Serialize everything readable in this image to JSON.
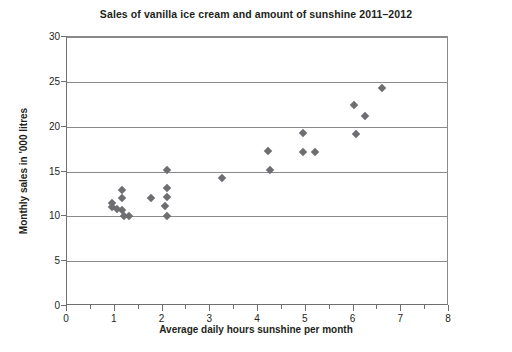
{
  "chart_data": {
    "type": "scatter",
    "title": "Sales of vanilla ice cream and amount of sunshine 2011–2012",
    "xlabel": "Average daily hours sunshine per month",
    "ylabel": "Monthly sales in '000 litres",
    "xlim": [
      0,
      8
    ],
    "ylim": [
      0,
      30
    ],
    "xticks": [
      0,
      1,
      2,
      3,
      4,
      5,
      6,
      7,
      8
    ],
    "xtick_labels": [
      "0",
      "1",
      "2",
      "3",
      "4",
      "5",
      "6",
      "7",
      "8"
    ],
    "xminor_step": 0.5,
    "yticks": [
      0,
      5,
      10,
      15,
      20,
      25,
      30
    ],
    "ytick_labels": [
      "0",
      "5",
      "10",
      "15",
      "20",
      "25",
      "30"
    ],
    "grid": "horizontal",
    "legend": null,
    "marker": "diamond",
    "marker_color": "#6e6e72",
    "points": [
      {
        "x": 0.95,
        "y": 11.5
      },
      {
        "x": 0.95,
        "y": 11.0
      },
      {
        "x": 1.15,
        "y": 12.9
      },
      {
        "x": 1.15,
        "y": 12.0
      },
      {
        "x": 1.05,
        "y": 10.8
      },
      {
        "x": 1.15,
        "y": 10.7
      },
      {
        "x": 1.2,
        "y": 10.0
      },
      {
        "x": 1.3,
        "y": 10.0
      },
      {
        "x": 1.75,
        "y": 12.1
      },
      {
        "x": 2.1,
        "y": 15.2
      },
      {
        "x": 2.1,
        "y": 13.2
      },
      {
        "x": 2.1,
        "y": 12.2
      },
      {
        "x": 2.05,
        "y": 11.2
      },
      {
        "x": 2.1,
        "y": 10.0
      },
      {
        "x": 3.25,
        "y": 14.3
      },
      {
        "x": 4.2,
        "y": 17.3
      },
      {
        "x": 4.25,
        "y": 15.2
      },
      {
        "x": 4.95,
        "y": 19.3
      },
      {
        "x": 4.95,
        "y": 17.2
      },
      {
        "x": 5.2,
        "y": 17.2
      },
      {
        "x": 6.0,
        "y": 22.4
      },
      {
        "x": 6.05,
        "y": 19.2
      },
      {
        "x": 6.25,
        "y": 21.2
      },
      {
        "x": 6.6,
        "y": 24.3
      }
    ]
  }
}
